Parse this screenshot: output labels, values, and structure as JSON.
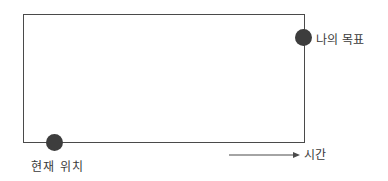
{
  "diagram": {
    "type": "path-from-current-to-goal",
    "labels": {
      "current_position": "현재 위치",
      "goal": "나의 목표",
      "time_axis": "시간"
    },
    "colors": {
      "line": "#4a4a4a",
      "dot": "#3d3d3d",
      "text": "#3a3a3a"
    }
  }
}
